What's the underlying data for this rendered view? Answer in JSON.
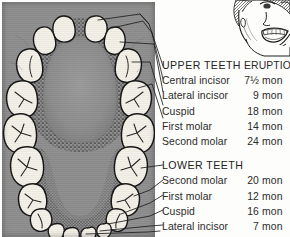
{
  "figure": {
    "type": "dental-eruption-chart",
    "panel_color": "#8e8e8e",
    "tooth_color": "#f2efe6",
    "ink_color": "#1c1c1c"
  },
  "columns": {
    "tooth_header": "UPPER TEETH",
    "time_header": "ERUPTIO"
  },
  "upper": {
    "header": "UPPER TEETH",
    "time_header": "ERUPTIO",
    "teeth": [
      {
        "name": "Central incisor",
        "number": "7½",
        "unit": "mon"
      },
      {
        "name": "Lateral incisor",
        "number": "9",
        "unit": "mon"
      },
      {
        "name": "Cuspid",
        "number": "18",
        "unit": "mon"
      },
      {
        "name": "First molar",
        "number": "14",
        "unit": "mon"
      },
      {
        "name": "Second molar",
        "number": "24",
        "unit": "mon"
      }
    ]
  },
  "lower": {
    "header": "LOWER TEETH",
    "teeth": [
      {
        "name": "Second molar",
        "number": "20",
        "unit": "mon"
      },
      {
        "name": "First molar",
        "number": "12",
        "unit": "mon"
      },
      {
        "name": "Cuspid",
        "number": "16",
        "unit": "mon"
      },
      {
        "name": "Lateral incisor",
        "number": "7",
        "unit": "mon"
      },
      {
        "name": "Central incisor",
        "number": "6",
        "unit": "mon"
      }
    ]
  }
}
